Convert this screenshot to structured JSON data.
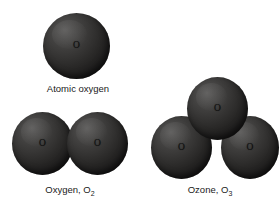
{
  "figure": {
    "background_color": "#ffffff",
    "sphere_highlight_color": "#4f4e4d",
    "sphere_shadow_color": "#121111",
    "label_color": "#1a1a1a",
    "molecules": [
      {
        "id": "atomic-oxygen",
        "caption": "Atomic oxygen",
        "formula_base": "",
        "formula_sub": "",
        "atom_count": 1,
        "atoms": [
          {
            "element_label": "O"
          }
        ]
      },
      {
        "id": "dioxygen",
        "caption": "Oxygen, O",
        "formula_base": "Oxygen, O",
        "formula_sub": "2",
        "atom_count": 2,
        "atoms": [
          {
            "element_label": "O"
          },
          {
            "element_label": "O"
          }
        ]
      },
      {
        "id": "ozone",
        "caption": "Ozone, O",
        "formula_base": "Ozone, O",
        "formula_sub": "3",
        "atom_count": 3,
        "atoms": [
          {
            "element_label": "O"
          },
          {
            "element_label": "O"
          },
          {
            "element_label": "O"
          }
        ]
      }
    ]
  }
}
